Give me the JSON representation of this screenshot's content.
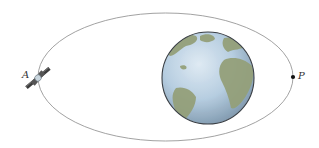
{
  "diagram": {
    "type": "elliptical-orbit",
    "labels": {
      "apogee": "A",
      "perigee": "P"
    },
    "orbit": {
      "cx": 165.5,
      "cy": 77,
      "rx": 127.5,
      "ry": 64,
      "stroke": "#8a8a8a"
    },
    "earth": {
      "cx": 208,
      "cy": 78,
      "r": 46,
      "ocean": "#b9cfe0",
      "land": "#8e9a72",
      "rim": "#3a3f45"
    },
    "satellite": {
      "x": 38,
      "y": 78
    },
    "perigee_point": {
      "x": 293,
      "y": 77
    }
  }
}
